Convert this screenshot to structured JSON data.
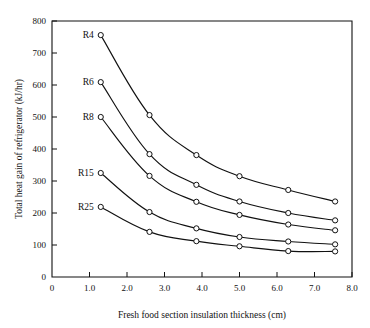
{
  "chart_data": {
    "type": "line",
    "title": "",
    "xlabel": "Fresh food section insulation thickness (cm)",
    "ylabel": "Total heat gain of refrigerator (kJ/hr)",
    "xlim": [
      0,
      8.0
    ],
    "ylim": [
      0,
      800
    ],
    "xticks": [
      0,
      1.0,
      2.0,
      3.0,
      4.0,
      5.0,
      6.0,
      7.0,
      8.0
    ],
    "xtick_labels": [
      "0",
      "1.0",
      "2.0",
      "3.0",
      "4.0",
      "5.0",
      "6.0",
      "7.0",
      "8.0"
    ],
    "yticks": [
      0,
      100,
      200,
      300,
      400,
      500,
      600,
      700,
      800
    ],
    "ytick_labels": [
      "0",
      "100",
      "200",
      "300",
      "400",
      "500",
      "600",
      "700",
      "800"
    ],
    "grid": false,
    "legend_position": "inline-left-labels",
    "x": [
      1.3,
      2.6,
      3.85,
      5.0,
      6.3,
      7.55
    ],
    "series": [
      {
        "name": "R4",
        "label": "R4",
        "values": [
          756,
          506,
          381,
          315,
          272,
          236
        ],
        "label_x": 1.3,
        "label_y": 756
      },
      {
        "name": "R6",
        "label": "R6",
        "values": [
          609,
          384,
          288,
          236,
          200,
          177
        ],
        "label_x": 1.3,
        "label_y": 609
      },
      {
        "name": "R8",
        "label": "R8",
        "values": [
          500,
          316,
          235,
          194,
          164,
          146
        ],
        "label_x": 1.3,
        "label_y": 500
      },
      {
        "name": "R15",
        "label": "R15",
        "values": [
          325,
          203,
          152,
          125,
          111,
          102
        ],
        "label_x": 1.3,
        "label_y": 325
      },
      {
        "name": "R25",
        "label": "R25",
        "values": [
          219,
          141,
          112,
          96,
          81,
          80
        ],
        "label_x": 1.3,
        "label_y": 219
      }
    ]
  }
}
